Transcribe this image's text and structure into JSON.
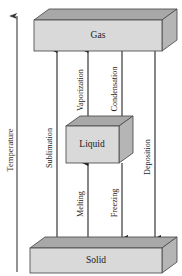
{
  "diagram": {
    "axis": {
      "label": "Temperature",
      "direction": "up",
      "icon": "up-arrow-icon"
    },
    "phases": [
      {
        "id": "gas",
        "label": "Gas"
      },
      {
        "id": "liquid",
        "label": "Liquid"
      },
      {
        "id": "solid",
        "label": "Solid"
      }
    ],
    "transitions": [
      {
        "id": "sublimation",
        "label": "Sublimation",
        "from": "Solid",
        "to": "Gas",
        "direction": "up"
      },
      {
        "id": "vaporization",
        "label": "Vaporization",
        "from": "Liquid",
        "to": "Gas",
        "direction": "up"
      },
      {
        "id": "condensation",
        "label": "Condensation",
        "from": "Gas",
        "to": "Liquid",
        "direction": "down"
      },
      {
        "id": "deposition",
        "label": "Deposition",
        "from": "Gas",
        "to": "Solid",
        "direction": "down"
      },
      {
        "id": "melting",
        "label": "Melting",
        "from": "Solid",
        "to": "Liquid",
        "direction": "up"
      },
      {
        "id": "freezing",
        "label": "Freezing",
        "from": "Liquid",
        "to": "Solid",
        "direction": "down"
      }
    ],
    "colors": {
      "box_front": "#d9d9d9",
      "box_top": "#a8a8a8",
      "box_side": "#b5b5b5",
      "outline": "#4a4a4a",
      "arrow": "#1a1a1a",
      "text": "#1a1a1a",
      "background": "#ffffff"
    }
  }
}
